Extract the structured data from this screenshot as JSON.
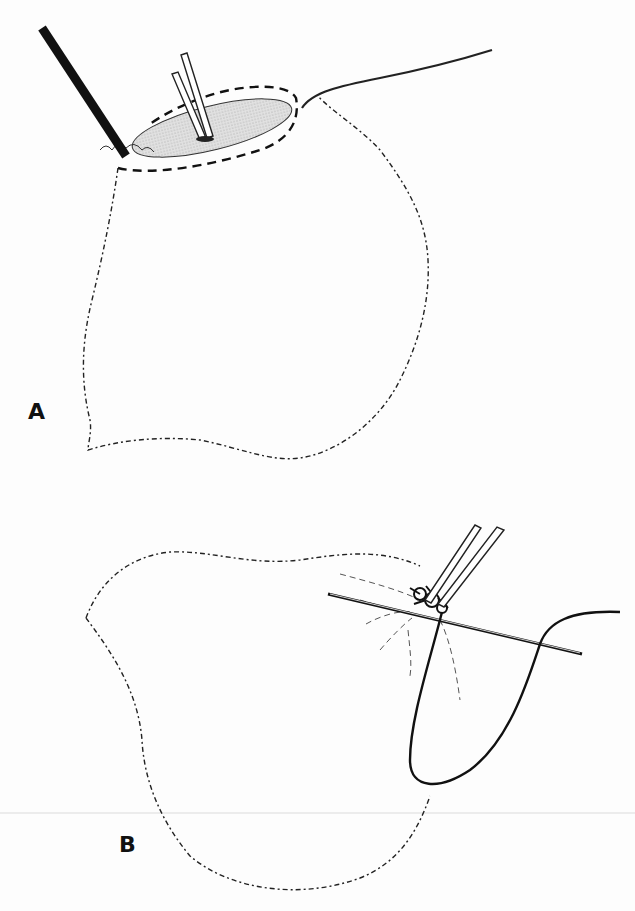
{
  "figure": {
    "panels": [
      {
        "id": "A",
        "label": "A",
        "description": "Sac with opened top; dark instrument inserted at left rim, double-bar clamp in shaded opening, dashed suture line around rim, thread trailing to upper right"
      },
      {
        "id": "B",
        "label": "B",
        "description": "Sac with neck gathered; double-bar clamp and needle passed through gathered tissue, thread forming a loop down the right side"
      }
    ],
    "colors": {
      "ink": "#111111",
      "shading": "#cfcfcf",
      "background": "#fdfdfd"
    }
  }
}
